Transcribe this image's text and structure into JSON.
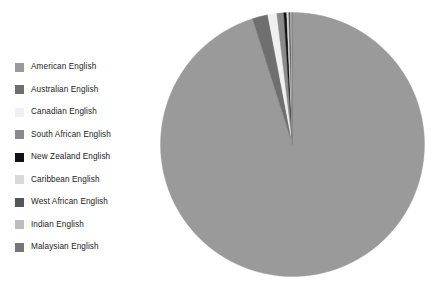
{
  "chart_data": {
    "type": "pie",
    "title": "",
    "legend_position": "left",
    "start_angle_deg": 90,
    "direction": "clockwise",
    "categories": [
      "American English",
      "Australian English",
      "Canadian English",
      "South African English",
      "New Zealand English",
      "Caribbean English",
      "West African English",
      "Indian English",
      "Malaysian English"
    ],
    "values": [
      95.1,
      1.9,
      1.1,
      0.85,
      0.35,
      0.25,
      0.2,
      0.15,
      0.1
    ],
    "colors": [
      "#9a9a9a",
      "#6f6f6f",
      "#f0f0f0",
      "#8a8a8a",
      "#111111",
      "#d9d9d9",
      "#555555",
      "#bdbdbd",
      "#767676"
    ],
    "slices": [
      {
        "label": "American English",
        "value": 95.1,
        "color": "#9a9a9a"
      },
      {
        "label": "Australian English",
        "value": 1.9,
        "color": "#6f6f6f"
      },
      {
        "label": "Canadian English",
        "value": 1.1,
        "color": "#f0f0f0"
      },
      {
        "label": "South African English",
        "value": 0.85,
        "color": "#8a8a8a"
      },
      {
        "label": "New Zealand English",
        "value": 0.35,
        "color": "#111111"
      },
      {
        "label": "Caribbean English",
        "value": 0.25,
        "color": "#d9d9d9"
      },
      {
        "label": "West African English",
        "value": 0.2,
        "color": "#555555"
      },
      {
        "label": "Indian English",
        "value": 0.15,
        "color": "#bdbdbd"
      },
      {
        "label": "Malaysian English",
        "value": 0.1,
        "color": "#767676"
      }
    ]
  },
  "legend": {
    "items": [
      {
        "label": "American English",
        "color": "#9a9a9a"
      },
      {
        "label": "Australian English",
        "color": "#6f6f6f"
      },
      {
        "label": "Canadian English",
        "color": "#f0f0f0"
      },
      {
        "label": "South African English",
        "color": "#8a8a8a"
      },
      {
        "label": "New Zealand English",
        "color": "#111111"
      },
      {
        "label": "Caribbean English",
        "color": "#d9d9d9"
      },
      {
        "label": "West African English",
        "color": "#555555"
      },
      {
        "label": "Indian English",
        "color": "#bdbdbd"
      },
      {
        "label": "Malaysian English",
        "color": "#767676"
      }
    ]
  },
  "figure": {
    "background": "#ffffff",
    "pie_center_x": 133.5,
    "pie_center_y": 133.5,
    "pie_radius": 132
  }
}
